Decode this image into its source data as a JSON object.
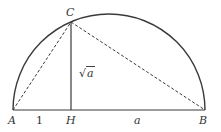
{
  "diagram": {
    "type": "semicircle-geometric-mean",
    "points": {
      "A": {
        "label": "A",
        "x": 13,
        "y": 110
      },
      "H": {
        "label": "H",
        "x": 71,
        "y": 110
      },
      "B": {
        "label": "B",
        "x": 205,
        "y": 110
      },
      "C": {
        "label": "C",
        "x": 71,
        "y": 22
      }
    },
    "segment_labels": {
      "AH": "1",
      "HB": "a",
      "CH_radical": "√",
      "CH_arg": "a"
    },
    "colors": {
      "stroke": "#3a3a3a",
      "dashed": "#3a3a3a",
      "text": "#333333"
    }
  }
}
